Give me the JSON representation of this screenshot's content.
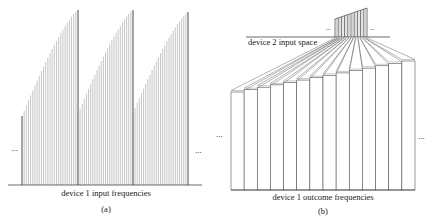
{
  "panel_a": {
    "axis_label": "device 1 input frequencies",
    "sublabel": "(a)",
    "ellipsis_left": "...",
    "ellipsis_right": "...",
    "baseline": {
      "y": 185,
      "x1": 8,
      "x2": 202
    },
    "teeth": [
      {
        "x_start": 22,
        "x_end": 78,
        "y_left": 116,
        "y_top": 10
      },
      {
        "x_start": 78,
        "x_end": 133,
        "y_left": 114,
        "y_top": 10
      },
      {
        "x_start": 133,
        "x_end": 188,
        "y_left": 113,
        "y_top": 12
      }
    ],
    "lines_per_tooth": 26,
    "line_color": "#8a8a8a",
    "edge_color": "#333333"
  },
  "panel_b": {
    "input_label": "device 2 input space",
    "axis_label": "device 1 outcome frequencies",
    "sublabel": "(b)",
    "ellipsis_left": "...",
    "ellipsis_right": "...",
    "small_ellipsis_left": "...",
    "small_ellipsis_right": "...",
    "input_axis": {
      "y": 37,
      "x1": 246,
      "x2": 390
    },
    "small_hist": {
      "x_start": 335,
      "x_end": 367,
      "y_left_top": 19,
      "y_right_top": 8,
      "bars": 10
    },
    "bars": {
      "count": 14,
      "x_start": 231,
      "x_end": 415,
      "bottom": 190,
      "top_left": 92,
      "top_right": 61
    },
    "line_color": "#555555"
  }
}
